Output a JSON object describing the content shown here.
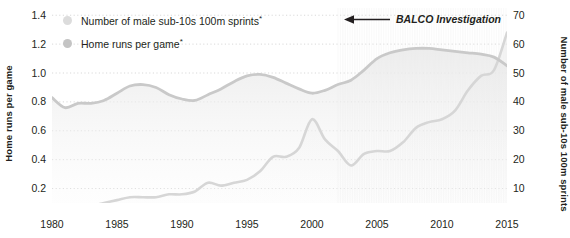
{
  "chart_data": {
    "type": "line",
    "title": "",
    "xlabel": "",
    "x": [
      1980,
      1981,
      1982,
      1983,
      1984,
      1985,
      1986,
      1987,
      1988,
      1989,
      1990,
      1991,
      1992,
      1993,
      1994,
      1995,
      1996,
      1997,
      1998,
      1999,
      2000,
      2001,
      2002,
      2003,
      2004,
      2005,
      2006,
      2007,
      2008,
      2009,
      2010,
      2011,
      2012,
      2013,
      2014,
      2015
    ],
    "xlim": [
      1980,
      2015
    ],
    "xticks_major": [
      1980,
      1985,
      1990,
      1995,
      2000,
      2005,
      2010,
      2015
    ],
    "xticks_minor_every": 1,
    "grid": "dotted-horizontal",
    "legend_position": "top-left",
    "series": [
      {
        "name": "Home runs per game",
        "axis": "left",
        "color": "#c9c9c9",
        "marker": "circle",
        "values": [
          0.83,
          0.76,
          0.79,
          0.79,
          0.81,
          0.86,
          0.91,
          0.92,
          0.9,
          0.85,
          0.82,
          0.81,
          0.85,
          0.89,
          0.94,
          0.98,
          0.99,
          0.97,
          0.93,
          0.89,
          0.86,
          0.88,
          0.92,
          0.95,
          1.02,
          1.1,
          1.14,
          1.16,
          1.17,
          1.17,
          1.16,
          1.15,
          1.14,
          1.13,
          1.11,
          1.05
        ]
      },
      {
        "name": "Number of male sub-10s 100m sprints",
        "axis": "right",
        "color": "#d6d6d6",
        "marker": "circle",
        "values": [
          3,
          3,
          4,
          4,
          5,
          6,
          7,
          7,
          7,
          8,
          8,
          9,
          12,
          11,
          12,
          13,
          16,
          21,
          21,
          24,
          34,
          27,
          23,
          18,
          22,
          23,
          23,
          26,
          31,
          33,
          34,
          37,
          44,
          49,
          51,
          64
        ]
      }
    ],
    "left_axis": {
      "label": "Home runs per game",
      "ticks": [
        "1.4",
        "1.2",
        "1.0",
        "0.8",
        "0.6",
        "0.4",
        "0.2"
      ],
      "tick_values": [
        1.4,
        1.2,
        1.0,
        0.8,
        0.6,
        0.4,
        0.2
      ],
      "lim": [
        0.1,
        1.45
      ]
    },
    "right_axis": {
      "label": "Number of male sub-10s 100m sprints",
      "ticks": [
        "70",
        "60",
        "50",
        "40",
        "30",
        "20",
        "10"
      ],
      "tick_values": [
        70,
        60,
        50,
        40,
        30,
        20,
        10
      ],
      "lim": [
        5,
        72.5
      ]
    },
    "annotations": [
      {
        "text": "BALCO Investigation",
        "arrow": "left",
        "points_to_year": 2003
      }
    ]
  },
  "legend": {
    "items": [
      {
        "label": "Number of male sub-10s 100m sprints",
        "footnote": "*",
        "color": "#dcdcdc"
      },
      {
        "label": "Home runs per game",
        "footnote": "*",
        "color": "#c4c4c4"
      }
    ]
  },
  "axis_titles": {
    "left": "Home runs per game",
    "right": "Number of male sub-10s 100m sprints"
  },
  "x_tick_labels": [
    "1980",
    "1985",
    "1990",
    "1995",
    "2000",
    "2005",
    "2010",
    "2015"
  ],
  "y_left_tick_labels": [
    "1.4",
    "1.2",
    "1.0",
    "0.8",
    "0.6",
    "0.4",
    "0.2"
  ],
  "y_right_tick_labels": [
    "70",
    "60",
    "50",
    "40",
    "30",
    "20",
    "10"
  ],
  "annotation": {
    "text": "BALCO Investigation"
  },
  "colors": {
    "background": "#ffffff",
    "text": "#231f20",
    "grid": "#d9d9d9",
    "series_home_runs": "#c9c9c9",
    "series_sprints": "#d6d6d6",
    "axis": "#8e8e8e"
  }
}
